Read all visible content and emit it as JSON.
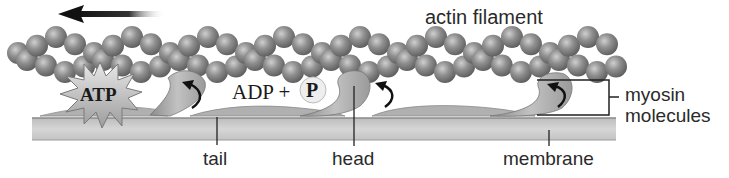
{
  "diagram": {
    "direction_arrow": {
      "direction": "left",
      "icon": "arrow-left-icon"
    },
    "labels": {
      "actin": "actin filament",
      "atp": "ATP",
      "adp": "ADP +",
      "phosphate": "P",
      "myosin_line1": "myosin",
      "myosin_line2": "molecules",
      "tail": "tail",
      "head": "head",
      "membrane": "membrane"
    },
    "colors": {
      "actin_bead": "#8a8a8a",
      "membrane": "#c8c8c8",
      "myosin": "#a9a9a9",
      "text": "#2a2a2a",
      "arrow": "#111111"
    }
  }
}
